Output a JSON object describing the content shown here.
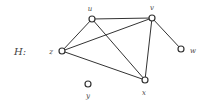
{
  "graph": {
    "name": "H:",
    "colors": {
      "edge": "#333333",
      "node_stroke": "#333333",
      "node_fill": "#ffffff",
      "label": "#444444"
    },
    "nodes": [
      {
        "id": "u",
        "label": "u",
        "x": 92,
        "y": 19,
        "lx": 90,
        "ly": 11
      },
      {
        "id": "v",
        "label": "v",
        "x": 152,
        "y": 18,
        "lx": 152,
        "ly": 10
      },
      {
        "id": "z",
        "label": "z",
        "x": 62,
        "y": 51,
        "lx": 51,
        "ly": 54
      },
      {
        "id": "w",
        "label": "w",
        "x": 181,
        "y": 49,
        "lx": 193,
        "ly": 53
      },
      {
        "id": "x",
        "label": "x",
        "x": 145,
        "y": 80,
        "lx": 144,
        "ly": 95
      },
      {
        "id": "y",
        "label": "y",
        "x": 88,
        "y": 84,
        "lx": 88,
        "ly": 98
      }
    ],
    "edges": [
      [
        "u",
        "v"
      ],
      [
        "u",
        "z"
      ],
      [
        "u",
        "x"
      ],
      [
        "v",
        "z"
      ],
      [
        "v",
        "x"
      ],
      [
        "v",
        "w"
      ],
      [
        "z",
        "x"
      ]
    ]
  }
}
